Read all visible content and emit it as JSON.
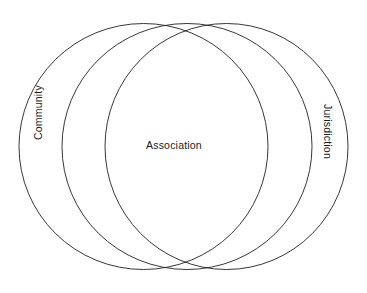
{
  "diagram": {
    "type": "venn",
    "background_color": "#ffffff",
    "stroke_color": "#202020",
    "text_color": "#1a1a1a",
    "sets": [
      {
        "id": "community",
        "label": "Community",
        "icon": "ellipse-outline-icon",
        "orientation": "rotated-90-ccw",
        "position": "left"
      },
      {
        "id": "association",
        "label": "Association",
        "icon": "ellipse-outline-icon",
        "orientation": "horizontal",
        "position": "center"
      },
      {
        "id": "jurisdiction",
        "label": "Jurisdiction",
        "icon": "ellipse-outline-icon",
        "orientation": "rotated-90-cw",
        "position": "right"
      }
    ],
    "geometry": {
      "left_ellipse": {
        "cx": 143.5,
        "cy": 146.5,
        "rx": 124.5,
        "ry": 123
      },
      "center_ellipse": {
        "cx": 187.0,
        "cy": 146.5,
        "rx": 125.0,
        "ry": 123
      },
      "right_ellipse": {
        "cx": 226.5,
        "cy": 146.5,
        "rx": 121.5,
        "ry": 123
      },
      "top_crossing": {
        "x": 183,
        "y": 24
      },
      "bottom_crossing": {
        "x": 183,
        "y": 268
      }
    }
  }
}
